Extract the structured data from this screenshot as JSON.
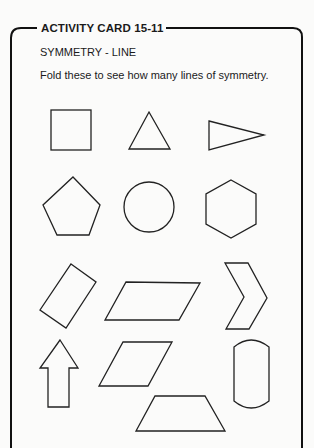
{
  "card": {
    "title": "ACTIVITY CARD 15-11",
    "subtitle": "SYMMETRY - LINE",
    "instructions": "Fold these to see how many lines of symmetry."
  },
  "shapes": [
    {
      "name": "square",
      "row": 1,
      "col": 1
    },
    {
      "name": "equilateral-triangle",
      "row": 1,
      "col": 2
    },
    {
      "name": "isosceles-triangle-pointing-right",
      "row": 1,
      "col": 3
    },
    {
      "name": "regular-pentagon",
      "row": 2,
      "col": 1
    },
    {
      "name": "circle",
      "row": 2,
      "col": 2
    },
    {
      "name": "regular-hexagon",
      "row": 2,
      "col": 3
    },
    {
      "name": "tilted-rectangle",
      "row": 3,
      "col": 1
    },
    {
      "name": "parallelogram",
      "row": 3,
      "col": 2
    },
    {
      "name": "chevron",
      "row": 3,
      "col": 3
    },
    {
      "name": "up-arrow",
      "row": 4,
      "col": 1
    },
    {
      "name": "rhombus",
      "row": 4,
      "col": 2
    },
    {
      "name": "capsule",
      "row": 4,
      "col": 3
    },
    {
      "name": "trapezoid",
      "row": 5,
      "col": 2
    }
  ],
  "colors": {
    "ink": "#222222",
    "paper": "#fbfbfa"
  }
}
